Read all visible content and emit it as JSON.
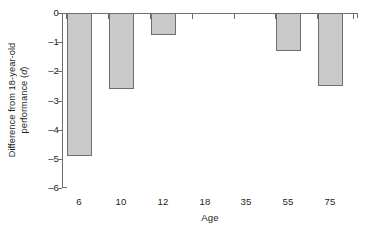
{
  "chart_data": {
    "type": "bar",
    "title": "",
    "subtitle": "",
    "xlabel": "Age",
    "ylabel": "Difference from 18-year-old performance (d)",
    "ylabel_line1": "Difference from 18-year-old",
    "ylabel_line2_pre": "performance (",
    "ylabel_line2_italic": "d",
    "ylabel_line2_post": ")",
    "categories": [
      "6",
      "10",
      "12",
      "18",
      "35",
      "55",
      "75"
    ],
    "values": [
      -4.9,
      -2.6,
      -0.75,
      0,
      0,
      -1.3,
      -2.5
    ],
    "series": [
      {
        "name": "Difference from 18-year-old performance",
        "values": [
          -4.9,
          -2.6,
          -0.75,
          0,
          0,
          -1.3,
          -2.5
        ]
      }
    ],
    "ylim": [
      -6,
      0
    ],
    "yticks": [
      0,
      -1,
      -2,
      -3,
      -4,
      -5,
      -6
    ],
    "ytick_labels": [
      "0",
      "–1",
      "–2",
      "–3",
      "–4",
      "–5",
      "–6"
    ],
    "grid": false,
    "legend": false,
    "legend_position": "none",
    "bar_fill_color": "#c9c9c9",
    "bar_border_color": "#6d6e71",
    "axis_color": "#6d6e71",
    "text_color": "#231f20",
    "background_color": "#ffffff",
    "annotations": []
  }
}
